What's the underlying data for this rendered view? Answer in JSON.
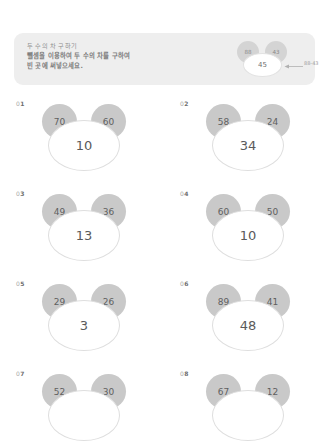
{
  "banner": {
    "title": "두 수의 차 구하기",
    "instruction_line1": "뺄셈을 이용하여 두 수의 차를 구하여",
    "instruction_line2": "빈 곳에 써넣으세요.",
    "background_color": "#eeeeee",
    "example": {
      "left_number": "88",
      "right_number": "43",
      "answer": "45",
      "arrow_label": "88-43"
    }
  },
  "colors": {
    "ear_fill": "#c9c9c9",
    "oval_fill": "#ffffff",
    "oval_stroke": "#dedede",
    "text": "#5a5a5a"
  },
  "problems": [
    {
      "index": "01",
      "index_prefix": "0",
      "index_digit": "1",
      "left": "70",
      "right": "60",
      "answer": "10"
    },
    {
      "index": "02",
      "index_prefix": "0",
      "index_digit": "2",
      "left": "58",
      "right": "24",
      "answer": "34"
    },
    {
      "index": "03",
      "index_prefix": "0",
      "index_digit": "3",
      "left": "49",
      "right": "36",
      "answer": "13"
    },
    {
      "index": "04",
      "index_prefix": "0",
      "index_digit": "4",
      "left": "60",
      "right": "50",
      "answer": "10"
    },
    {
      "index": "05",
      "index_prefix": "0",
      "index_digit": "5",
      "left": "29",
      "right": "26",
      "answer": "3"
    },
    {
      "index": "06",
      "index_prefix": "0",
      "index_digit": "6",
      "left": "89",
      "right": "41",
      "answer": "48"
    },
    {
      "index": "07",
      "index_prefix": "0",
      "index_digit": "7",
      "left": "52",
      "right": "30",
      "answer": ""
    },
    {
      "index": "08",
      "index_prefix": "0",
      "index_digit": "8",
      "left": "67",
      "right": "12",
      "answer": ""
    }
  ]
}
